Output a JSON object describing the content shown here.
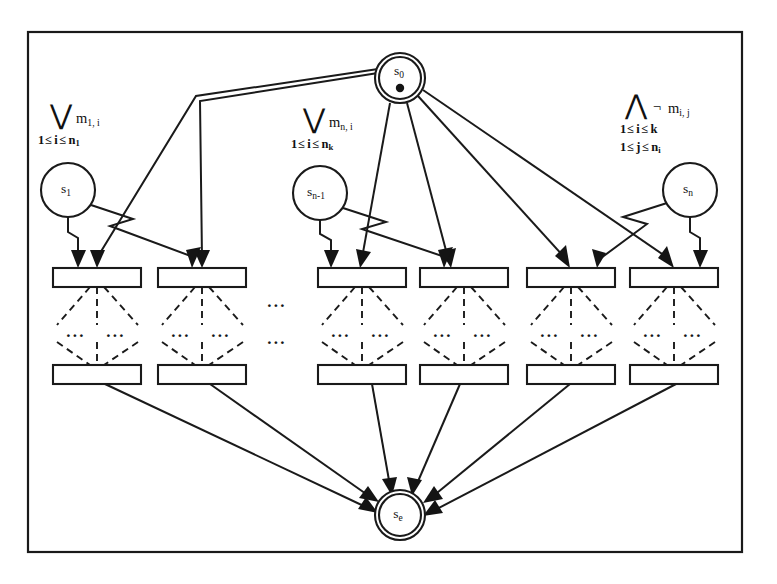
{
  "figure": {
    "type": "automaton-diagram",
    "background_color": "#ffffff",
    "line_color": "#1a1a1a",
    "frame": {
      "x": 28,
      "y": 32,
      "width": 714,
      "height": 520
    }
  },
  "nodes": {
    "start": {
      "id": "s0",
      "label": "s",
      "subscript": "0",
      "shape": "double-circle",
      "has_initial_dot": true,
      "cx": 400,
      "cy": 78,
      "r": 25
    },
    "end": {
      "id": "se",
      "label": "s",
      "subscript": "e",
      "shape": "double-circle",
      "has_initial_dot": false,
      "cx": 400,
      "cy": 515,
      "r": 25
    },
    "intermediate": [
      {
        "id": "s1",
        "label": "s",
        "subscript": "1",
        "shape": "circle",
        "cx": 68,
        "cy": 190,
        "r": 27
      },
      {
        "id": "sn-1",
        "label": "s",
        "subscript": "n-1",
        "shape": "circle",
        "cx": 320,
        "cy": 193,
        "r": 27
      },
      {
        "id": "sn",
        "label": "s",
        "subscript": "n",
        "shape": "circle",
        "cx": 690,
        "cy": 190,
        "r": 27
      }
    ]
  },
  "quantifier_labels": [
    {
      "id": "left-disjunction",
      "operator": "⋁",
      "operator_name": "big-or",
      "term": "m",
      "term_subscript": "1, i",
      "range_lines": [
        {
          "prefix": "1",
          "rel1": "≤",
          "var": "i",
          "rel2": "≤",
          "bound": "n",
          "bound_subscript": "1"
        }
      ],
      "x": 50,
      "y": 112
    },
    {
      "id": "middle-disjunction",
      "operator": "⋁",
      "operator_name": "big-or",
      "term": "m",
      "term_subscript": "n, i",
      "range_lines": [
        {
          "prefix": "1",
          "rel1": "≤",
          "var": "i",
          "rel2": "≤",
          "bound": "n",
          "bound_subscript": "k"
        }
      ],
      "x": 303,
      "y": 116
    },
    {
      "id": "right-conjunction",
      "operator": "⋀",
      "operator_name": "big-and",
      "negation": "¬",
      "term": "m",
      "term_subscript": "i, j",
      "range_lines": [
        {
          "prefix": "1",
          "rel1": "≤",
          "var": "i",
          "rel2": "≤",
          "bound": "k",
          "bound_subscript": ""
        },
        {
          "prefix": "1",
          "rel1": "≤",
          "var": "j",
          "rel2": "≤",
          "bound": "n",
          "bound_subscript": "i"
        }
      ],
      "x": 625,
      "y": 104
    }
  ],
  "process_boxes": {
    "row_top_y": 268,
    "row_bottom_y": 365,
    "box_width": 88,
    "box_height": 19,
    "columns_x": [
      53,
      158,
      318,
      420,
      527,
      630
    ]
  },
  "ellipsis_markers": [
    {
      "id": "column-gap-upper",
      "text": "...",
      "x": 277,
      "y": 303,
      "orientation": "horizontal"
    },
    {
      "id": "column-gap-lower",
      "text": "...",
      "x": 277,
      "y": 340,
      "orientation": "horizontal"
    },
    {
      "id": "box-fan-1-left",
      "text": "...",
      "x": 76,
      "y": 333,
      "orientation": "horizontal"
    },
    {
      "id": "box-fan-1-right",
      "text": "...",
      "x": 116,
      "y": 333,
      "orientation": "horizontal"
    },
    {
      "id": "box-fan-2-left",
      "text": "...",
      "x": 181,
      "y": 333,
      "orientation": "horizontal"
    },
    {
      "id": "box-fan-2-right",
      "text": "...",
      "x": 221,
      "y": 333,
      "orientation": "horizontal"
    },
    {
      "id": "box-fan-3-left",
      "text": "...",
      "x": 341,
      "y": 333,
      "orientation": "horizontal"
    },
    {
      "id": "box-fan-3-right",
      "text": "...",
      "x": 381,
      "y": 333,
      "orientation": "horizontal"
    },
    {
      "id": "box-fan-4-left",
      "text": "...",
      "x": 443,
      "y": 333,
      "orientation": "horizontal"
    },
    {
      "id": "box-fan-4-right",
      "text": "...",
      "x": 483,
      "y": 333,
      "orientation": "horizontal"
    },
    {
      "id": "box-fan-5-left",
      "text": "...",
      "x": 550,
      "y": 333,
      "orientation": "horizontal"
    },
    {
      "id": "box-fan-5-right",
      "text": "...",
      "x": 590,
      "y": 333,
      "orientation": "horizontal"
    },
    {
      "id": "box-fan-6-left",
      "text": "...",
      "x": 653,
      "y": 333,
      "orientation": "horizontal"
    },
    {
      "id": "box-fan-6-right",
      "text": "...",
      "x": 693,
      "y": 333,
      "orientation": "horizontal"
    }
  ]
}
